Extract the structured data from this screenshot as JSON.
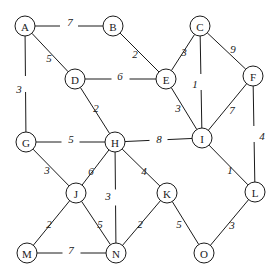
{
  "diagram": {
    "type": "weighted-undirected-graph",
    "title": "",
    "canvas": {
      "width": 278,
      "height": 276
    },
    "style": {
      "node_radius": 10,
      "node_fill": "#ffffff",
      "stroke_color": "#1a1a1a",
      "label_color": "#1a1a1a"
    },
    "nodes": [
      {
        "id": "A",
        "label": "A",
        "x": 25,
        "y": 26
      },
      {
        "id": "B",
        "label": "B",
        "x": 113,
        "y": 26
      },
      {
        "id": "C",
        "label": "C",
        "x": 200,
        "y": 26
      },
      {
        "id": "D",
        "label": "D",
        "x": 75,
        "y": 79
      },
      {
        "id": "E",
        "label": "E",
        "x": 166,
        "y": 79
      },
      {
        "id": "F",
        "label": "F",
        "x": 253,
        "y": 76
      },
      {
        "id": "G",
        "label": "G",
        "x": 26,
        "y": 142
      },
      {
        "id": "H",
        "label": "H",
        "x": 115,
        "y": 142
      },
      {
        "id": "I",
        "label": "I",
        "x": 202,
        "y": 138
      },
      {
        "id": "J",
        "label": "J",
        "x": 76,
        "y": 193
      },
      {
        "id": "K",
        "label": "K",
        "x": 167,
        "y": 193
      },
      {
        "id": "L",
        "label": "L",
        "x": 255,
        "y": 192
      },
      {
        "id": "M",
        "label": "M",
        "x": 27,
        "y": 253
      },
      {
        "id": "N",
        "label": "N",
        "x": 116,
        "y": 253
      },
      {
        "id": "O",
        "label": "O",
        "x": 204,
        "y": 253
      }
    ],
    "edges": [
      {
        "source": "A",
        "target": "B",
        "weight": "7",
        "lx": 70,
        "ly": 22,
        "gap": 9
      },
      {
        "source": "A",
        "target": "D",
        "weight": "5",
        "lx": 49,
        "ly": 58,
        "gap": 0
      },
      {
        "source": "A",
        "target": "G",
        "weight": "3",
        "lx": 19,
        "ly": 89,
        "gap": 8
      },
      {
        "source": "B",
        "target": "E",
        "weight": "2",
        "lx": 135,
        "ly": 54,
        "gap": 0
      },
      {
        "source": "C",
        "target": "E",
        "weight": "3",
        "lx": 184,
        "ly": 52,
        "gap": 0
      },
      {
        "source": "C",
        "target": "I",
        "weight": "1",
        "lx": 195,
        "ly": 84,
        "gap": 8
      },
      {
        "source": "C",
        "target": "F",
        "weight": "9",
        "lx": 233,
        "ly": 49,
        "gap": 0
      },
      {
        "source": "D",
        "target": "E",
        "weight": "6",
        "lx": 120,
        "ly": 76,
        "gap": 9
      },
      {
        "source": "D",
        "target": "H",
        "weight": "2",
        "lx": 96,
        "ly": 108,
        "gap": 0
      },
      {
        "source": "E",
        "target": "I",
        "weight": "3",
        "lx": 178,
        "ly": 108,
        "gap": 0
      },
      {
        "source": "F",
        "target": "I",
        "weight": "7",
        "lx": 232,
        "ly": 110,
        "gap": 0
      },
      {
        "source": "F",
        "target": "L",
        "weight": "4",
        "lx": 262,
        "ly": 136,
        "gap": 8
      },
      {
        "source": "G",
        "target": "H",
        "weight": "5",
        "lx": 71,
        "ly": 139,
        "gap": 9
      },
      {
        "source": "G",
        "target": "J",
        "weight": "3",
        "lx": 47,
        "ly": 170,
        "gap": 0
      },
      {
        "source": "H",
        "target": "I",
        "weight": "8",
        "lx": 159,
        "ly": 139,
        "gap": 9
      },
      {
        "source": "H",
        "target": "J",
        "weight": "6",
        "lx": 91,
        "ly": 171,
        "gap": 0
      },
      {
        "source": "H",
        "target": "N",
        "weight": "3",
        "lx": 108,
        "ly": 196,
        "gap": 8
      },
      {
        "source": "H",
        "target": "K",
        "weight": "4",
        "lx": 144,
        "ly": 171,
        "gap": 0
      },
      {
        "source": "I",
        "target": "L",
        "weight": "1",
        "lx": 230,
        "ly": 170,
        "gap": 0
      },
      {
        "source": "J",
        "target": "M",
        "weight": "2",
        "lx": 49,
        "ly": 224,
        "gap": 0
      },
      {
        "source": "J",
        "target": "N",
        "weight": "5",
        "lx": 100,
        "ly": 224,
        "gap": 0
      },
      {
        "source": "K",
        "target": "N",
        "weight": "2",
        "lx": 140,
        "ly": 224,
        "gap": 0
      },
      {
        "source": "K",
        "target": "O",
        "weight": "5",
        "lx": 179,
        "ly": 224,
        "gap": 0
      },
      {
        "source": "L",
        "target": "O",
        "weight": "3",
        "lx": 232,
        "ly": 225,
        "gap": 0
      },
      {
        "source": "M",
        "target": "N",
        "weight": "7",
        "lx": 71,
        "ly": 250,
        "gap": 9
      }
    ]
  }
}
